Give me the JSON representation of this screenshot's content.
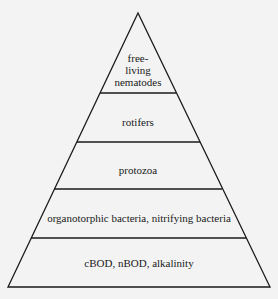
{
  "diagram": {
    "type": "pyramid",
    "levels": [
      {
        "label_lines": [
          "free-",
          "living",
          "nematodes"
        ]
      },
      {
        "label": "rotifers"
      },
      {
        "label": "protozoa"
      },
      {
        "label": "organotorphic bacteria, nitrifying bacteria"
      },
      {
        "label": "cBOD, nBOD, alkalinity"
      }
    ],
    "line_color": "#1a1a1a",
    "background_color": "#f3f3f3"
  }
}
